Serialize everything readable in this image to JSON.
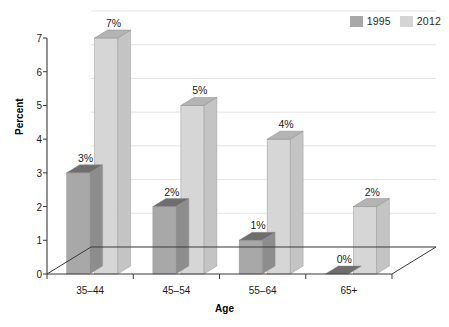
{
  "chart_data": {
    "type": "bar",
    "title": "",
    "subtitle": "",
    "xlabel": "Age",
    "ylabel": "Percent",
    "categories": [
      "35–44",
      "45–54",
      "55–64",
      "65+"
    ],
    "series": [
      {
        "name": "1995",
        "color": "#a8a8a8",
        "values": [
          3,
          2,
          1,
          0
        ],
        "labels": [
          "3%",
          "2%",
          "1%",
          "0%"
        ]
      },
      {
        "name": "2012",
        "color": "#d4d4d4",
        "values": [
          7,
          5,
          4,
          2
        ],
        "labels": [
          "7%",
          "5%",
          "4%",
          "2%"
        ]
      }
    ],
    "ylim": [
      0,
      7
    ],
    "yticks": [
      0,
      1,
      2,
      3,
      4,
      5,
      6,
      7
    ],
    "ytick_labels": [
      "0",
      "1",
      "2",
      "3",
      "4",
      "5",
      "6",
      "7"
    ],
    "grid": true,
    "grid_axis": "y",
    "legend_position": "top-right",
    "style": "3d-column"
  },
  "legend": {
    "entries": [
      {
        "label": "1995",
        "swatch_color": "#a8a8a8"
      },
      {
        "label": "2012",
        "swatch_color": "#d4d4d4"
      }
    ]
  },
  "axes": {
    "y_title": "Percent",
    "x_title": "Age"
  },
  "colors": {
    "bar_1995_front": "#a8a8a8",
    "bar_1995_top": "#6e6e6e",
    "bar_1995_side": "#8d8d8d",
    "bar_2012_front": "#d6d6d6",
    "bar_2012_top": "#b4b4b4",
    "bar_2012_side": "#c4c4c4",
    "gridline": "#e4e4e4",
    "axis": "#3a3a3a",
    "text": "#1a1a1a",
    "background": "#ffffff"
  }
}
